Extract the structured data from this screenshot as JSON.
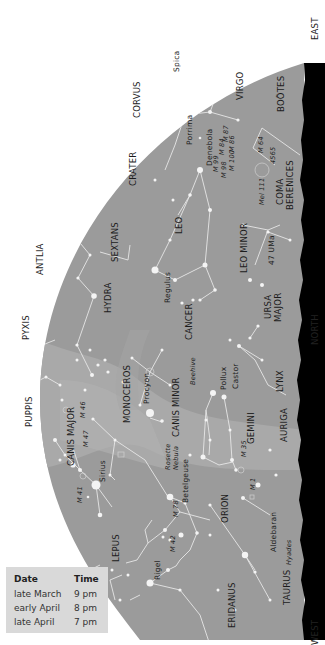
{
  "colors": {
    "sky": "#9b9b9b",
    "milky_way": "#adadad",
    "horizon": "#000000",
    "lines": "#e6e6e6",
    "stars": "#f4f4f4",
    "legend_bg": "#d9d9d9"
  },
  "directions": {
    "east": "EAST",
    "north": "NORTH",
    "west": "WEST"
  },
  "constellations": {
    "corvus": "CORVUS",
    "virgo": "VIRGO",
    "bootes": "BOÖTES",
    "crater": "CRATER",
    "coma_berenices_1": "COMA",
    "coma_berenices_2": "BERENICES",
    "antlia": "ANTLIA",
    "sextans": "SEXTANS",
    "leo": "LEO",
    "leo_minor": "LEO MINOR",
    "hydra": "HYDRA",
    "pyxis": "PYXIS",
    "ursa_major_1": "URSA",
    "ursa_major_2": "MAJOR",
    "cancer": "CANCER",
    "puppis": "PUPPIS",
    "monoceros": "MONOCEROS",
    "canis_minor": "CANIS MINOR",
    "canis_major": "CANIS MAJOR",
    "lynx": "LYNX",
    "gemini": "GEMINI",
    "auriga": "AURIGA",
    "orion": "ORION",
    "lepus": "LEPUS",
    "taurus": "TAURUS",
    "eridanus": "ERIDANUS"
  },
  "stars": {
    "spica": "Spica",
    "porrima": "Porrima",
    "denebola": "Denebola",
    "regulus": "Regulus",
    "procyon": "Procyon",
    "pollux": "Pollux",
    "castor": "Castor",
    "sirius": "Sirius",
    "betelgeuse": "Betelgeuse",
    "rigel": "Rigel",
    "aldebaran": "Aldebaran",
    "uma47": "47 UMa"
  },
  "deep_sky": {
    "m99": "M 99",
    "m84": "M 84",
    "m87": "M 87",
    "m98": "M 98",
    "m86": "M 86",
    "m100": "M 100",
    "m64": "M 64",
    "n4565": "4565",
    "mel111": "Mel 111",
    "beehive": "Beehive",
    "rosette_1": "Rosette",
    "rosette_2": "Nebula",
    "m46": "M 46",
    "m47": "M 47",
    "m41": "M 41",
    "m35": "M 35",
    "m1": "M 1",
    "m78": "M 78",
    "m42": "M 42",
    "hyades": "Hyades"
  },
  "legend": {
    "header": {
      "date": "Date",
      "time": "Time"
    },
    "rows": [
      {
        "date": "late March",
        "time": "9 pm"
      },
      {
        "date": "early April",
        "time": "8 pm"
      },
      {
        "date": "late April",
        "time": "7 pm"
      }
    ]
  }
}
